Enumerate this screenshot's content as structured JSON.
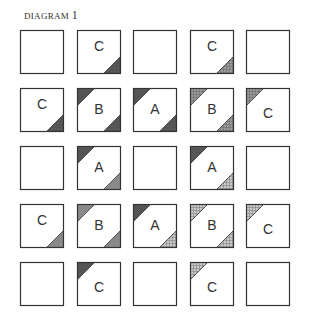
{
  "title": {
    "text": "DIAGRAM",
    "number": "1"
  },
  "fills": {
    "dark": "#555555",
    "gray": "#8a8a8a",
    "darkcheck": "#5a5a5a",
    "check": "#9a9a9a",
    "lightcheck": "#c8c8c8"
  },
  "grid": {
    "cols": [
      20,
      77,
      133,
      190,
      246
    ],
    "rows": [
      30,
      88,
      146,
      204,
      262
    ],
    "blocks": [
      [
        {
          "label": ""
        },
        {
          "label": "C",
          "br": "darkcheck"
        },
        {
          "label": ""
        },
        {
          "label": "C",
          "br": "check"
        },
        {
          "label": ""
        }
      ],
      [
        {
          "label": "C",
          "br": "darkcheck"
        },
        {
          "label": "B",
          "tl": "dark",
          "br": "darkcheck"
        },
        {
          "label": "A",
          "tl": "dark",
          "br": "darkcheck"
        },
        {
          "label": "B",
          "tl": "check",
          "br": "check"
        },
        {
          "label": "C",
          "tl": "check"
        }
      ],
      [
        {
          "label": ""
        },
        {
          "label": "A",
          "tl": "dark",
          "br": "gray"
        },
        {
          "label": ""
        },
        {
          "label": "A",
          "tl": "darkcheck",
          "br": "lightcheck"
        },
        {
          "label": ""
        }
      ],
      [
        {
          "label": "C",
          "br": "gray"
        },
        {
          "label": "B",
          "tl": "gray",
          "br": "gray"
        },
        {
          "label": "A",
          "tl": "dark",
          "br": "lightcheck"
        },
        {
          "label": "B",
          "tl": "lightcheck",
          "br": "lightcheck"
        },
        {
          "label": "C",
          "tl": "lightcheck"
        }
      ],
      [
        {
          "label": ""
        },
        {
          "label": "C",
          "tl": "dark"
        },
        {
          "label": ""
        },
        {
          "label": "C",
          "tl": "lightcheck"
        },
        {
          "label": ""
        }
      ]
    ]
  }
}
